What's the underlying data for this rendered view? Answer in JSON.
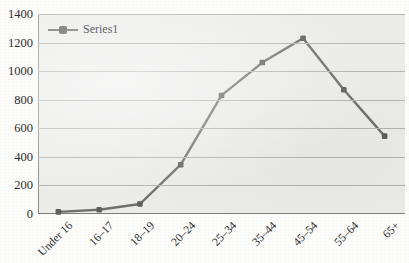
{
  "page": {
    "title_remnant": "               ",
    "background_color": "#fdfdfc",
    "plot_background_color": "#ececeb",
    "series_color": "#6f6f6d",
    "marker_color": "#5f5f5d",
    "gridline_color": "#b4b4b2",
    "axis_color": "#7e7e7c"
  },
  "legend": {
    "position": "top-left-inside",
    "entries": [
      {
        "label": "Series1",
        "color": "#6f6f6d",
        "marker": "square"
      }
    ]
  },
  "chart_data": {
    "type": "line",
    "title": "",
    "xlabel": "",
    "ylabel": "",
    "categories": [
      "Under 16",
      "16–17",
      "18–19",
      "20–24",
      "25–34",
      "35–44",
      "45–54",
      "55–64",
      "65+"
    ],
    "series": [
      {
        "name": "Series1",
        "color": "#6f6f6d",
        "marker": "square",
        "values": [
          15,
          30,
          70,
          345,
          830,
          1060,
          1230,
          870,
          545
        ]
      }
    ],
    "ylim": [
      0,
      1400
    ],
    "yticks": [
      0,
      200,
      400,
      600,
      800,
      1000,
      1200,
      1400
    ],
    "ytick_labels": [
      "0",
      "200",
      "400",
      "600",
      "800",
      "1000",
      "1200",
      "1400"
    ],
    "grid": true,
    "grid_axis": "y",
    "legend_position": "top-left",
    "xtick_rotation": -45
  }
}
